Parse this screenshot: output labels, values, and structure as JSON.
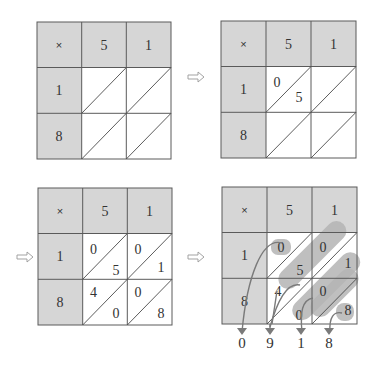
{
  "diagram": {
    "colors": {
      "header_fill": "#d6d6d6",
      "grid_line": "#5a5a5a",
      "highlight": "#b4b4b4",
      "arrow": "#7a7a7a"
    },
    "operator": "×",
    "top_digits": [
      "5",
      "1"
    ],
    "left_digits": [
      "1",
      "8"
    ],
    "step_arrow": "⇨",
    "panels": [
      {
        "id": "step-1",
        "cells": [
          {
            "tens": "",
            "units": ""
          },
          {
            "tens": "",
            "units": ""
          },
          {
            "tens": "",
            "units": ""
          },
          {
            "tens": "",
            "units": ""
          }
        ]
      },
      {
        "id": "step-2",
        "cells": [
          {
            "tens": "0",
            "units": "5"
          },
          {
            "tens": "",
            "units": ""
          },
          {
            "tens": "",
            "units": ""
          },
          {
            "tens": "",
            "units": ""
          }
        ]
      },
      {
        "id": "step-3",
        "cells": [
          {
            "tens": "0",
            "units": "5"
          },
          {
            "tens": "0",
            "units": "1"
          },
          {
            "tens": "4",
            "units": "0"
          },
          {
            "tens": "0",
            "units": "8"
          }
        ]
      },
      {
        "id": "step-4",
        "cells": [
          {
            "tens": "0",
            "units": "5"
          },
          {
            "tens": "0",
            "units": "1"
          },
          {
            "tens": "4",
            "units": "0"
          },
          {
            "tens": "0",
            "units": "8"
          }
        ],
        "result_digits": [
          "0",
          "9",
          "1",
          "8"
        ]
      }
    ]
  }
}
